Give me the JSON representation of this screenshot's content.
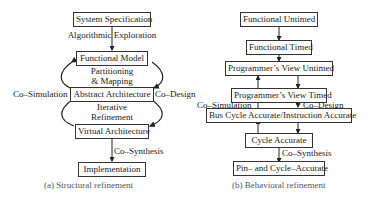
{
  "left": {
    "boxes": {
      "system_spec": "System Specification",
      "functional_model": "Functional Model",
      "abstract_arch": "Abstract Architecture",
      "virtual_arch": "Virtual Architecture",
      "implementation": "Implementation"
    },
    "labels": {
      "algorithmic": "Algorithmic Exploration",
      "partitioning_1": "Partitioning",
      "partitioning_2": "& Mapping",
      "iterative_1": "Iterative",
      "iterative_2": "Refinement",
      "co_sim": "Co–Simulation",
      "co_design": "Co–Design",
      "co_synth": "Co–Synthesis"
    },
    "caption": "(a) Structural refinement"
  },
  "right": {
    "boxes": {
      "func_untimed": "Functional Untimed",
      "func_timed": "Functional Timed",
      "pv_untimed": "Programmer’s View Untimed",
      "pv_timed": "Programmer’s View Timed",
      "bus_cycle": "Bus Cycle Accurate/Instruction Accurate",
      "cycle_acc": "Cycle Accurate",
      "pin_cycle": "Pin– and Cycle–Accurate"
    },
    "labels": {
      "co_sim": "Co–Simulation",
      "co_design": "Co–Design",
      "co_synth": "Co–Synthesis"
    },
    "caption": "(b) Behavioral refinement"
  }
}
